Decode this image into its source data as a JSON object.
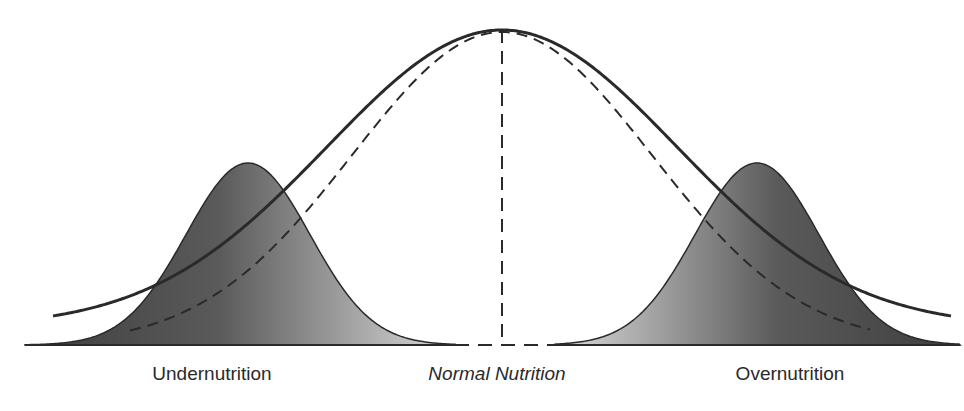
{
  "labels": {
    "left": "Undernutrition",
    "center": "Normal Nutrition",
    "right": "Overnutrition"
  },
  "colors": {
    "background": "#ffffff",
    "line": "#2a2a2a",
    "fill_dark": "#4a4a4a",
    "fill_light": "#d8d8d8"
  },
  "diagram": {
    "baseline_y": 345,
    "center_x": 502,
    "main_curve": {
      "peak_x": 502,
      "peak_y": 30,
      "sigma": 175,
      "tail_left": [
        53,
        328
      ],
      "tail_right": [
        952,
        325
      ],
      "style": "solid"
    },
    "dashed_curve": {
      "peak_x": 502,
      "peak_y": 30,
      "sigma": 150,
      "x_start": 130,
      "x_end": 870,
      "style": "dashed"
    },
    "left_bell": {
      "peak_x": 248,
      "peak_y": 163,
      "sigma": 62,
      "x_start": 25,
      "x_end": 455,
      "gradient": "dark-to-light"
    },
    "right_bell": {
      "peak_x": 757,
      "peak_y": 163,
      "sigma": 62,
      "x_start": 555,
      "x_end": 960,
      "gradient": "light-to-dark"
    },
    "center_line": {
      "x": 502,
      "y_top": 30,
      "y_bottom": 345,
      "style": "dashed"
    }
  }
}
